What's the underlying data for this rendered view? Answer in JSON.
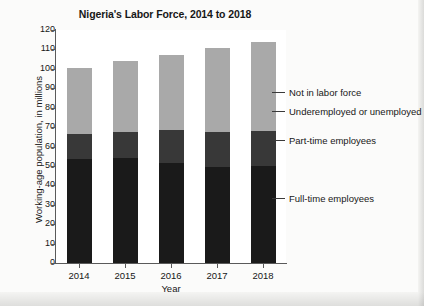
{
  "chart_data": {
    "type": "bar",
    "subtype": "stacked-vertical-bar",
    "title": "Nigeria's Labor Force, 2014 to 2018",
    "xlabel": "Year",
    "ylabel": "Working-age population, in millions",
    "categories": [
      "2014",
      "2015",
      "2016",
      "2017",
      "2018"
    ],
    "ylim": [
      0,
      120
    ],
    "ytick_step": 10,
    "yticks": [
      "120",
      "110",
      "100",
      "90",
      "80",
      "70",
      "60",
      "50",
      "40",
      "30",
      "20",
      "10",
      "0"
    ],
    "grid": false,
    "legend_position": "right-callouts",
    "stack_order_bottom_to_top": [
      "Full-time employees",
      "Part-time employees",
      "Not in labor force"
    ],
    "series": [
      {
        "name": "Full-time employees",
        "color": "#1a1a1a",
        "values": [
          53.5,
          54.0,
          51.5,
          49.5,
          50.0
        ]
      },
      {
        "name": "Part-time employees",
        "color": "#383838",
        "values": [
          13.0,
          13.5,
          17.0,
          18.0,
          18.0
        ]
      },
      {
        "name": "Not in labor force",
        "color": "#a9a9a9",
        "values": [
          34.0,
          36.5,
          38.5,
          43.5,
          46.0
        ]
      }
    ],
    "totals": [
      100.5,
      104.0,
      107.0,
      111.0,
      114.0
    ],
    "callouts": [
      {
        "label": "Not in labor force",
        "y_value": 88
      },
      {
        "label": "Underemployed or unemployed",
        "y_value": 78
      },
      {
        "label": "Part-time employees",
        "y_value": 63
      },
      {
        "label": "Full-time employees",
        "y_value": 33
      }
    ]
  }
}
